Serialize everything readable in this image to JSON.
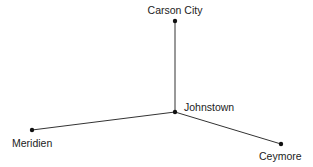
{
  "diagram": {
    "type": "network-map",
    "nodes": [
      {
        "id": "carson_city",
        "label": "Carson City"
      },
      {
        "id": "johnstown",
        "label": "Johnstown"
      },
      {
        "id": "meridien",
        "label": "Meridien"
      },
      {
        "id": "ceymore",
        "label": "Ceymore"
      }
    ],
    "edges": [
      {
        "from": "Johnstown",
        "to": "Carson City"
      },
      {
        "from": "Johnstown",
        "to": "Meridien"
      },
      {
        "from": "Johnstown",
        "to": "Ceymore"
      }
    ],
    "colors": {
      "line": "#333333",
      "node": "#111111",
      "text": "#222222",
      "background": "#ffffff"
    }
  }
}
